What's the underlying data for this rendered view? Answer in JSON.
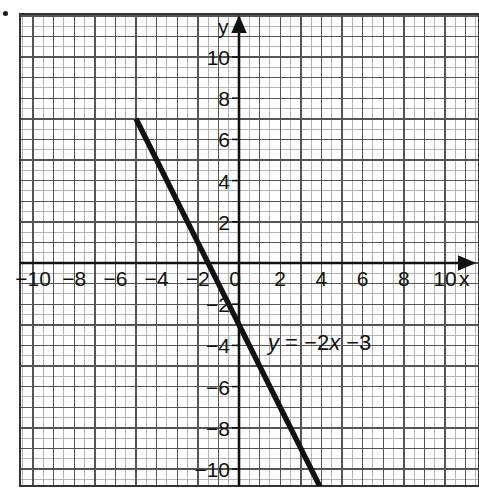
{
  "figure": {
    "bullet_marker": "•",
    "background_color": "#ffffff",
    "line_color": "#111111",
    "grid_minor_color": "#b4b4b4",
    "grid_major_color": "#555555",
    "axis_color": "#111111",
    "frame_color": "#333333"
  },
  "axes": {
    "x_axis_name": "x",
    "y_axis_name": "y",
    "origin_label": "0"
  },
  "chart_data": {
    "type": "line",
    "title": "",
    "subtitle": "",
    "xlabel": "x",
    "ylabel": "y",
    "equation": "y = -2x - 3",
    "equation_parts": {
      "lhs": "y",
      "equals": "=",
      "slope_term": "-2x",
      "intercept_term": "-3"
    },
    "annotations": [
      {
        "text": "y = -2x -3",
        "x": 1.6,
        "y": -3.9
      }
    ],
    "slope": -2,
    "y_intercept": -3,
    "x_intercept": -1.5,
    "xlim": [
      -10.65,
      11.5
    ],
    "ylim": [
      -11.6,
      12.1
    ],
    "grid": true,
    "grid_minor_step": 0.5,
    "grid_major_step": 1,
    "legend_position": "none",
    "xticks": [
      -10,
      -8,
      -6,
      -4,
      -2,
      0,
      2,
      4,
      6,
      8,
      10
    ],
    "xticklabels": [
      "-10",
      "-8",
      "-6",
      "-4",
      "-2",
      "0",
      "2",
      "4",
      "6",
      "8",
      "10"
    ],
    "yticks": [
      -10,
      -8,
      -6,
      -4,
      -2,
      2,
      4,
      6,
      8,
      10
    ],
    "yticklabels": [
      "-10",
      "-8",
      "-6",
      "-4",
      "-2",
      "2",
      "4",
      "6",
      "8",
      "10"
    ],
    "series": [
      {
        "name": "y = -2x -3",
        "points": [
          {
            "x": -5,
            "y": 7
          },
          {
            "x": -4,
            "y": 5
          },
          {
            "x": -3,
            "y": 3
          },
          {
            "x": -2,
            "y": 1
          },
          {
            "x": -1.5,
            "y": 0
          },
          {
            "x": -1,
            "y": -1
          },
          {
            "x": 0,
            "y": -3
          },
          {
            "x": 1,
            "y": -5
          },
          {
            "x": 2,
            "y": -7
          },
          {
            "x": 3,
            "y": -9
          },
          {
            "x": 4,
            "y": -11
          }
        ],
        "x_start": -5.05,
        "x_end": 4.2
      }
    ]
  }
}
